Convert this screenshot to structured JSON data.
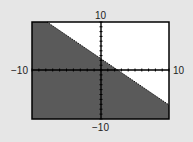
{
  "chart_data": {
    "type": "area",
    "title": "",
    "xlim": [
      -10,
      10
    ],
    "ylim": [
      -10,
      10
    ],
    "xlabel": "",
    "ylabel": "",
    "tick_labels": {
      "xmin": "−10",
      "xmax": "10",
      "ymin": "−10",
      "ymax": "10"
    },
    "x_tick_step": 1,
    "y_tick_step": 1,
    "boundary_line": {
      "slope": -0.7,
      "intercept": 2,
      "points": [
        [
          -7.8,
          10
        ],
        [
          10,
          -5
        ]
      ]
    },
    "shaded_region": "below",
    "shade_color": "#555555",
    "background_color": "#ffffff"
  },
  "labels": {
    "ymax": "10",
    "ymin": "−10",
    "xmin": "−10",
    "xmax": "10"
  }
}
